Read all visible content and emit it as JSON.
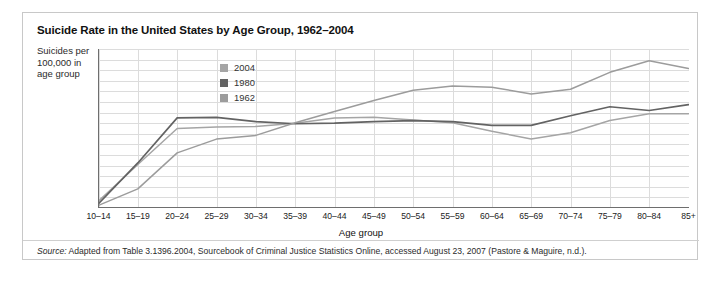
{
  "figure": {
    "title": "Suicide Rate in the United States by Age Group, 1962–2004",
    "ylabel": "Suicides per 100,000 in age group",
    "source_label": "Source:",
    "source_text": " Adapted from Table 3.1396.2004, Sourcebook of Criminal Justice Statistics Online, accessed August 23, 2007 (Pastore & Maguire, n.d.)."
  },
  "colors": {
    "series_2004": "#a5a5a5",
    "series_1980": "#636363",
    "series_1962": "#9c9c9c",
    "grid": "#dcdcdc",
    "axis": "#6e6e6e",
    "frame": "#c8c8c8"
  },
  "chart_data": {
    "type": "line",
    "title": "Suicide Rate in the United States by Age Group, 1962–2004",
    "xlabel": "Age group",
    "ylabel": "Suicides per 100,000 in age group",
    "ylim": [
      0,
      30
    ],
    "ytick_step": 2,
    "yticks": [
      0,
      2,
      4,
      6,
      8,
      10,
      12,
      14,
      16,
      18,
      20,
      22,
      24,
      26,
      28,
      30
    ],
    "grid": true,
    "legend_position": "inside-upper-center",
    "categories": [
      "10–14",
      "15–19",
      "20–24",
      "25–29",
      "30–34",
      "35–39",
      "40–44",
      "45–49",
      "50–54",
      "55–59",
      "60–64",
      "65–69",
      "70–74",
      "75–79",
      "80–84",
      "85+"
    ],
    "series": [
      {
        "name": "2004",
        "color": "#a5a5a5",
        "values": [
          1.3,
          8.2,
          15.0,
          15.3,
          15.4,
          16.0,
          17.0,
          17.1,
          16.6,
          16.1,
          14.5,
          13.0,
          14.2,
          16.5,
          17.8,
          17.8
        ]
      },
      {
        "name": "1980",
        "color": "#636363",
        "values": [
          0.8,
          8.5,
          17.0,
          17.1,
          16.3,
          15.9,
          16.0,
          16.3,
          16.5,
          16.3,
          15.6,
          15.6,
          17.4,
          19.1,
          18.4,
          19.5
        ]
      },
      {
        "name": "1962",
        "color": "#9c9c9c",
        "values": [
          0.5,
          3.6,
          10.4,
          13.0,
          13.7,
          16.1,
          18.2,
          20.3,
          22.2,
          23.0,
          22.8,
          21.5,
          22.4,
          25.6,
          27.8,
          26.3
        ]
      }
    ]
  },
  "legend": {
    "items": [
      {
        "label": "2004",
        "color": "#a5a5a5"
      },
      {
        "label": "1980",
        "color": "#636363"
      },
      {
        "label": "1962",
        "color": "#9c9c9c"
      }
    ]
  }
}
